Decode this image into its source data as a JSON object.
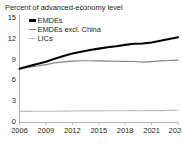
{
  "chart_data": {
    "type": "line",
    "title": "Percent of advanced-economy level",
    "xlabel": "",
    "ylabel": "",
    "grid": false,
    "legend_position": "top-left",
    "ylim": [
      0,
      15
    ],
    "yticks": [
      0,
      3,
      6,
      9,
      12,
      15
    ],
    "ytick_labels": [
      "0",
      "3",
      "6",
      "9",
      "12",
      "15"
    ],
    "xticks": [
      2006,
      2009,
      2012,
      2015,
      2018,
      2021,
      2024
    ],
    "xtick_labels": [
      "2006",
      "2009",
      "2012",
      "2015",
      "2018",
      "2021",
      "2024f"
    ],
    "x": [
      2006,
      2007,
      2008,
      2009,
      2010,
      2011,
      2012,
      2013,
      2014,
      2015,
      2016,
      2017,
      2018,
      2019,
      2020,
      2021,
      2022,
      2023,
      2024
    ],
    "series": [
      {
        "name": "EMDEs",
        "color": "#000000",
        "width": 2.1,
        "values": [
          7.75,
          8.1,
          8.45,
          8.75,
          9.2,
          9.6,
          9.95,
          10.2,
          10.45,
          10.65,
          10.85,
          11.0,
          11.2,
          11.35,
          11.4,
          11.55,
          11.8,
          12.05,
          12.3
        ]
      },
      {
        "name": "EMDEs excl. China",
        "color": "#808285",
        "width": 1.15,
        "values": [
          7.75,
          7.95,
          8.15,
          8.35,
          8.6,
          8.75,
          8.85,
          8.9,
          8.9,
          8.88,
          8.85,
          8.83,
          8.82,
          8.8,
          8.7,
          8.78,
          8.88,
          8.95,
          9.0
        ]
      },
      {
        "name": "LICs",
        "color": "#bcbec0",
        "width": 1.15,
        "values": [
          1.6,
          1.6,
          1.62,
          1.62,
          1.63,
          1.65,
          1.66,
          1.67,
          1.68,
          1.68,
          1.69,
          1.7,
          1.7,
          1.71,
          1.7,
          1.71,
          1.72,
          1.74,
          1.76
        ]
      }
    ]
  },
  "legend": {
    "items": [
      {
        "label": "EMDEs",
        "color": "#000000"
      },
      {
        "label": "EMDEs excl. China",
        "color": "#808285"
      },
      {
        "label": "LICs",
        "color": "#bcbec0"
      }
    ]
  },
  "axis": {
    "axis_color": "#a7a9ac"
  }
}
